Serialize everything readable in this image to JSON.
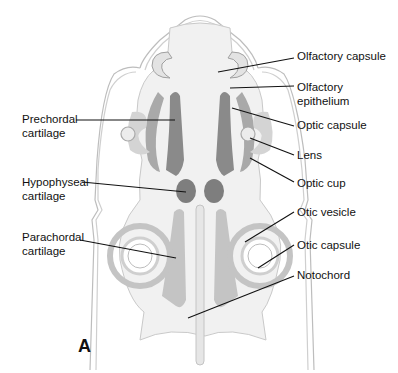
{
  "figure": {
    "panel_letter": "A",
    "colors": {
      "outline": "#b5b5b5",
      "body_fill": "#f1f1f1",
      "dark_cartilage": "#8a8a8a",
      "mid_cartilage": "#a9a9a9",
      "light_structure": "#cfcfcf",
      "leader_line": "#111111"
    }
  },
  "labels": {
    "left": [
      {
        "id": "prechordal",
        "text": "Prechordal\ncartilage"
      },
      {
        "id": "hypophyseal",
        "text": "Hypophyseal\ncartilage"
      },
      {
        "id": "parachordal",
        "text": "Parachordal\ncartilage"
      }
    ],
    "right": [
      {
        "id": "olfactory_capsule",
        "text": "Olfactory capsule"
      },
      {
        "id": "olfactory_epithelium",
        "text": "Olfactory\nepithelium"
      },
      {
        "id": "optic_capsule",
        "text": "Optic capsule"
      },
      {
        "id": "lens",
        "text": "Lens"
      },
      {
        "id": "optic_cup",
        "text": "Optic cup"
      },
      {
        "id": "otic_vesicle",
        "text": "Otic vesicle"
      },
      {
        "id": "otic_capsule",
        "text": "Otic capsule"
      },
      {
        "id": "notochord",
        "text": "Notochord"
      }
    ]
  }
}
